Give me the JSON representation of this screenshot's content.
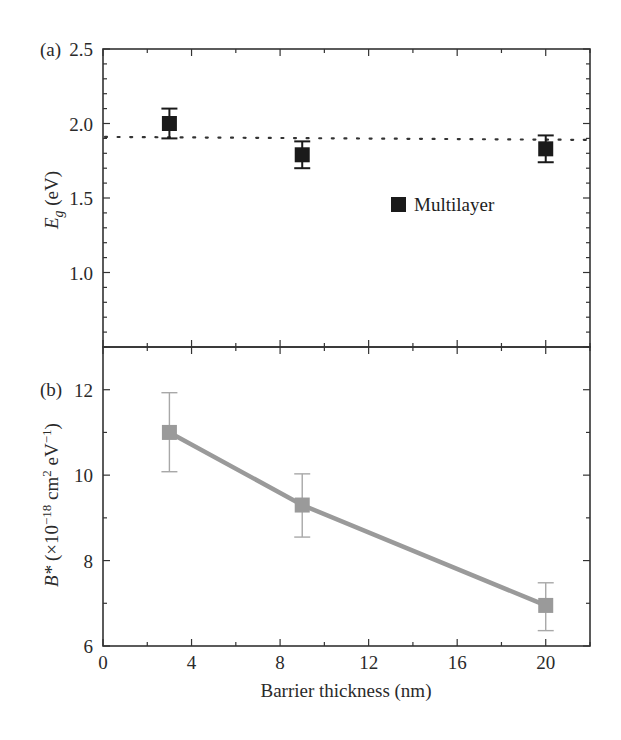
{
  "chart_data": [
    {
      "panel": "(a)",
      "type": "scatter",
      "title": "",
      "xlabel": "Barrier thickness (nm)",
      "ylabel": "E_g (eV)",
      "ylabel_parts": {
        "symbol": "E",
        "subscript": "g",
        "unit": " (eV)"
      },
      "xlim": [
        0,
        22
      ],
      "ylim": [
        0.5,
        2.5
      ],
      "y_ticks": [
        1.0,
        1.5,
        2.0,
        2.5
      ],
      "y_tick_labels": [
        "1.0",
        "1.5",
        "2.0",
        "2.5"
      ],
      "x_ticks": [
        0,
        4,
        8,
        12,
        16,
        20
      ],
      "grid": false,
      "legend": {
        "entries": [
          "Multilayer"
        ],
        "position": "inside-right"
      },
      "series": [
        {
          "name": "Multilayer",
          "marker": "square",
          "color": "#1a1a1a",
          "x": [
            3,
            9,
            20
          ],
          "y": [
            2.0,
            1.79,
            1.83
          ],
          "y_err_upper": [
            2.1,
            1.88,
            1.92
          ],
          "y_err_lower": [
            1.9,
            1.7,
            1.74
          ]
        }
      ],
      "reference_line": {
        "style": "dotted",
        "y_start": 1.91,
        "y_end": 1.89,
        "color": "#333333"
      }
    },
    {
      "panel": "(b)",
      "type": "line",
      "title": "",
      "xlabel": "Barrier thickness (nm)",
      "ylabel": "B* (×10^-18 cm^2 eV^-1)",
      "xlim": [
        0,
        22
      ],
      "ylim": [
        6,
        13
      ],
      "y_ticks": [
        6,
        8,
        10,
        12
      ],
      "y_tick_labels": [
        "6",
        "8",
        "10",
        "12"
      ],
      "x_ticks": [
        0,
        4,
        8,
        12,
        16,
        20
      ],
      "x_tick_labels": [
        "0",
        "4",
        "8",
        "12",
        "16",
        "20"
      ],
      "grid": false,
      "series": [
        {
          "name": "B*",
          "marker": "square",
          "color": "#9a9a9a",
          "x": [
            3,
            9,
            20
          ],
          "y": [
            11.0,
            9.3,
            6.95
          ],
          "y_err_upper": [
            11.93,
            10.03,
            7.48
          ],
          "y_err_lower": [
            10.08,
            8.55,
            6.36
          ]
        }
      ]
    }
  ],
  "labels": {
    "panel_a": "(a)",
    "panel_b": "(b)",
    "legend_multilayer": "Multilayer",
    "xlabel": "Barrier thickness (nm)",
    "ylabel_a_symbol": "E",
    "ylabel_a_sub": "g",
    "ylabel_a_unit": " (eV)",
    "ylabel_b_symbol": "B*",
    "ylabel_b_pre": " (×10",
    "ylabel_b_exp1": "−18",
    "ylabel_b_mid": " cm",
    "ylabel_b_exp2": "2",
    "ylabel_b_mid2": " eV",
    "ylabel_b_exp3": "−1",
    "ylabel_b_post": ")"
  }
}
